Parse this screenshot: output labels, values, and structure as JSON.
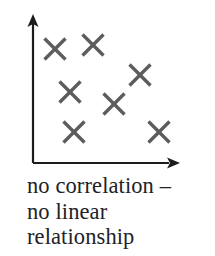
{
  "figure": {
    "kind": "scatter-plot-diagram",
    "width": 215,
    "height": 256,
    "background_color": "#ffffff"
  },
  "axes": {
    "color": "#1c1c1e",
    "line_width": 2.2,
    "origin": {
      "x": 33,
      "y": 163
    },
    "y_axis": {
      "name": "y-axis",
      "from_y": 163,
      "to_y": 14,
      "has_arrowhead": true
    },
    "x_axis": {
      "name": "x-axis",
      "from_x": 33,
      "to_x": 179,
      "has_arrowhead": true
    },
    "arrowhead": {
      "length": 13,
      "half_width": 5.5
    }
  },
  "markers": {
    "glyph": "x",
    "color": "#5c5c5e",
    "stroke_width": 3.4,
    "half_size": 10.5
  },
  "caption": {
    "color": "#222225",
    "lines": [
      "no correlation –",
      "no linear",
      "relationship"
    ]
  },
  "chart_data": {
    "type": "scatter",
    "title": "no correlation – no linear relationship",
    "xlabel": "",
    "ylabel": "",
    "grid": false,
    "legend": false,
    "axis_arrows": true,
    "tick_labels": {
      "x": [],
      "y": []
    },
    "xlim": [
      33,
      179
    ],
    "ylim": [
      14,
      163
    ],
    "series": [
      {
        "name": "observations",
        "marker": "x",
        "color": "#5c5c5e",
        "points": [
          {
            "x": 55,
            "y": 49
          },
          {
            "x": 93,
            "y": 45
          },
          {
            "x": 140,
            "y": 75
          },
          {
            "x": 70,
            "y": 92
          },
          {
            "x": 114,
            "y": 104
          },
          {
            "x": 74,
            "y": 132
          },
          {
            "x": 159,
            "y": 132
          }
        ]
      }
    ],
    "n_points": 7,
    "annotation": "Points are scattered with no discernible linear trend."
  }
}
